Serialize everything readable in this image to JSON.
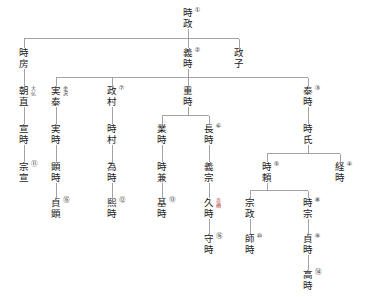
{
  "diagram": {
    "type": "genealogy-tree",
    "orientation": "top-down",
    "line_color": "#8c8c8c",
    "text_color": "#1b1b1b",
    "accent_red": "#b03a3a",
    "background": "#ffffff"
  },
  "nodes": [
    {
      "id": "tokimasa",
      "name": "時政",
      "num": "①",
      "side": "",
      "x": 188,
      "y": 8
    },
    {
      "id": "tokifusa",
      "name": "時房",
      "num": "",
      "side": "",
      "x": 24,
      "y": 48
    },
    {
      "id": "yoshitoki",
      "name": "義時",
      "num": "②",
      "side": "",
      "x": 188,
      "y": 48
    },
    {
      "id": "masako",
      "name": "政子",
      "num": "",
      "side": "",
      "x": 239,
      "y": 48
    },
    {
      "id": "tomonao",
      "name": "朝直",
      "num": "",
      "side": "大仏",
      "x": 24,
      "y": 86
    },
    {
      "id": "sanetai",
      "name": "実泰",
      "num": "",
      "side": "金沢",
      "x": 56,
      "y": 86
    },
    {
      "id": "masamura",
      "name": "政村",
      "num": "⑦",
      "side": "",
      "x": 112,
      "y": 86
    },
    {
      "id": "shigetoki",
      "name": "重時",
      "num": "",
      "side": "",
      "x": 188,
      "y": 86
    },
    {
      "id": "yasutoki",
      "name": "泰時",
      "num": "③",
      "side": "",
      "x": 308,
      "y": 86
    },
    {
      "id": "nobutoki",
      "name": "宣時",
      "num": "",
      "side": "",
      "x": 24,
      "y": 124
    },
    {
      "id": "sanetoki",
      "name": "実時",
      "num": "",
      "side": "",
      "x": 56,
      "y": 124
    },
    {
      "id": "tokimura",
      "name": "時村",
      "num": "",
      "side": "",
      "x": 112,
      "y": 124
    },
    {
      "id": "narutoki",
      "name": "業時",
      "num": "",
      "side": "",
      "x": 162,
      "y": 124
    },
    {
      "id": "nagatoki",
      "name": "長時",
      "num": "⑥",
      "side": "",
      "x": 209,
      "y": 124
    },
    {
      "id": "tokiuji",
      "name": "時氏",
      "num": "",
      "side": "",
      "x": 308,
      "y": 124
    },
    {
      "id": "munenobu",
      "name": "宗宣",
      "num": "⑪",
      "side": "",
      "x": 24,
      "y": 162
    },
    {
      "id": "akitoki",
      "name": "顕時",
      "num": "",
      "side": "",
      "x": 56,
      "y": 162
    },
    {
      "id": "tametoki",
      "name": "為時",
      "num": "",
      "side": "",
      "x": 112,
      "y": 162
    },
    {
      "id": "tokikane",
      "name": "時兼",
      "num": "",
      "side": "",
      "x": 162,
      "y": 162
    },
    {
      "id": "yoshimune",
      "name": "義宗",
      "num": "",
      "side": "",
      "x": 209,
      "y": 162
    },
    {
      "id": "tokiyori",
      "name": "時頼",
      "num": "⑤",
      "side": "",
      "x": 267,
      "y": 162
    },
    {
      "id": "tsunetoki",
      "name": "経時",
      "num": "④",
      "side": "",
      "x": 340,
      "y": 162
    },
    {
      "id": "sadaaki",
      "name": "貞顕",
      "num": "⑮",
      "side": "",
      "x": 56,
      "y": 198
    },
    {
      "id": "hirotoki",
      "name": "熙時",
      "num": "⑫",
      "side": "",
      "x": 112,
      "y": 198
    },
    {
      "id": "mototoki",
      "name": "基時",
      "num": "⑬",
      "side": "",
      "x": 162,
      "y": 198
    },
    {
      "id": "hisatoki",
      "name": "久時",
      "num": "",
      "side": "赤橋",
      "x": 209,
      "y": 198
    },
    {
      "id": "munemasa",
      "name": "宗政",
      "num": "",
      "side": "",
      "x": 250,
      "y": 198
    },
    {
      "id": "tokimune",
      "name": "時宗",
      "num": "⑧",
      "side": "",
      "x": 308,
      "y": 198
    },
    {
      "id": "moritoki",
      "name": "守時",
      "num": "⑯",
      "side": "",
      "x": 209,
      "y": 234
    },
    {
      "id": "morotoki",
      "name": "師時",
      "num": "⑩",
      "side": "",
      "x": 250,
      "y": 234
    },
    {
      "id": "sadatoki",
      "name": "貞時",
      "num": "⑨",
      "side": "",
      "x": 308,
      "y": 234
    },
    {
      "id": "takatoki",
      "name": "高時",
      "num": "⑭",
      "side": "",
      "x": 308,
      "y": 270
    }
  ],
  "edges": [
    {
      "from": "tokimasa",
      "to": "tokifusa"
    },
    {
      "from": "tokimasa",
      "to": "yoshitoki"
    },
    {
      "from": "tokimasa",
      "to": "masako"
    },
    {
      "from": "tokifusa",
      "to": "tomonao"
    },
    {
      "from": "yoshitoki",
      "to": "sanetai"
    },
    {
      "from": "yoshitoki",
      "to": "masamura"
    },
    {
      "from": "yoshitoki",
      "to": "shigetoki"
    },
    {
      "from": "yoshitoki",
      "to": "yasutoki"
    },
    {
      "from": "tomonao",
      "to": "nobutoki"
    },
    {
      "from": "sanetai",
      "to": "sanetoki"
    },
    {
      "from": "masamura",
      "to": "tokimura"
    },
    {
      "from": "shigetoki",
      "to": "narutoki"
    },
    {
      "from": "shigetoki",
      "to": "nagatoki"
    },
    {
      "from": "yasutoki",
      "to": "tokiuji"
    },
    {
      "from": "nobutoki",
      "to": "munenobu"
    },
    {
      "from": "sanetoki",
      "to": "akitoki"
    },
    {
      "from": "tokimura",
      "to": "tametoki"
    },
    {
      "from": "narutoki",
      "to": "tokikane"
    },
    {
      "from": "nagatoki",
      "to": "yoshimune"
    },
    {
      "from": "tokiuji",
      "to": "tokiyori"
    },
    {
      "from": "tokiuji",
      "to": "tsunetoki"
    },
    {
      "from": "akitoki",
      "to": "sadaaki"
    },
    {
      "from": "tametoki",
      "to": "hirotoki"
    },
    {
      "from": "tokikane",
      "to": "mototoki"
    },
    {
      "from": "yoshimune",
      "to": "hisatoki"
    },
    {
      "from": "tokiyori",
      "to": "munemasa"
    },
    {
      "from": "tokiyori",
      "to": "tokimune"
    },
    {
      "from": "hisatoki",
      "to": "moritoki"
    },
    {
      "from": "munemasa",
      "to": "morotoki"
    },
    {
      "from": "tokimune",
      "to": "sadatoki"
    },
    {
      "from": "sadatoki",
      "to": "takatoki"
    }
  ]
}
